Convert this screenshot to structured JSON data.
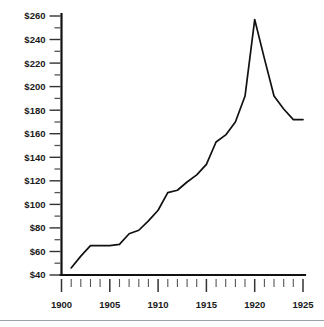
{
  "chart_data": {
    "type": "line",
    "title": "",
    "subtitle": "",
    "xlabel": "",
    "ylabel": "",
    "xlim": [
      1900,
      1925
    ],
    "ylim": [
      40,
      260
    ],
    "grid": false,
    "legend": null,
    "y_tick_labels": [
      "$260",
      "$240",
      "$220",
      "$200",
      "$180",
      "$160",
      "$140",
      "$120",
      "$100",
      "$80",
      "$60",
      "$40"
    ],
    "y_tick_values": [
      260,
      240,
      220,
      200,
      180,
      160,
      140,
      120,
      100,
      80,
      60,
      40
    ],
    "y_minor_step": 10,
    "x_tick_labels": [
      "1900",
      "1905",
      "1910",
      "1915",
      "1920",
      "1925"
    ],
    "x_tick_values": [
      1900,
      1905,
      1910,
      1915,
      1920,
      1925
    ],
    "x_minor_step": 1,
    "series": [
      {
        "name": "value",
        "color": "#111111",
        "x": [
          1901,
          1902,
          1903,
          1904,
          1905,
          1906,
          1907,
          1908,
          1909,
          1910,
          1911,
          1912,
          1913,
          1914,
          1915,
          1916,
          1917,
          1918,
          1919,
          1920,
          1921,
          1922,
          1923,
          1924,
          1925
        ],
        "values": [
          46,
          56,
          65,
          65,
          65,
          66,
          75,
          78,
          86,
          95,
          110,
          112,
          119,
          125,
          134,
          153,
          159,
          170,
          192,
          257,
          224,
          192,
          181,
          172,
          172
        ]
      }
    ]
  },
  "axis": {
    "y_axis_name": "dollar-axis",
    "x_axis_name": "year-axis"
  }
}
